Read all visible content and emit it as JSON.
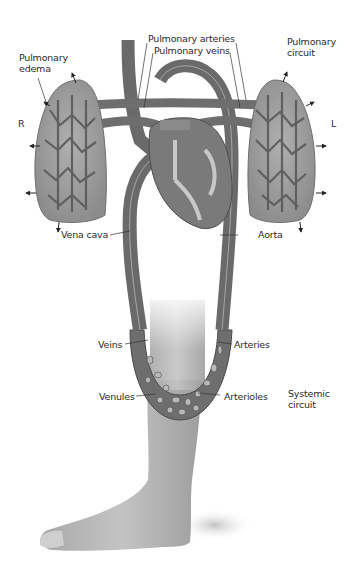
{
  "diagram": {
    "colors": {
      "vessel": "#7a7a7a",
      "vessel_dark": "#555555",
      "lung": "#9a9a9a",
      "lung_light": "#bdbdbd",
      "skin": "#b5b5b5",
      "heart": "#8a8a8a",
      "background": "#ffffff",
      "label_text": "#2a2a2a"
    },
    "labels": {
      "pulmonary_arteries": "Pulmonary arteries",
      "pulmonary_veins": "Pulmonary veins",
      "pulmonary_edema": "Pulmonary\nedema",
      "pulmonary_circuit": "Pulmonary\ncircuit",
      "right": "R",
      "left": "L",
      "vena_cava": "Vena cava",
      "aorta": "Aorta",
      "veins": "Veins",
      "arteries": "Arteries",
      "venules": "Venules",
      "arterioles": "Arterioles",
      "systemic_circuit": "Systemic\ncircuit"
    }
  }
}
